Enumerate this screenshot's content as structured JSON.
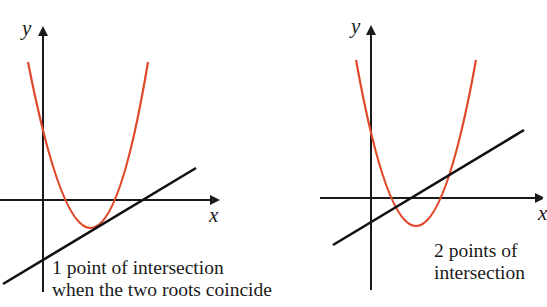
{
  "colors": {
    "curve": "#e0482a",
    "line": "#111111",
    "axes": "#1a1a1a",
    "background": "#ffffff"
  },
  "graphs": [
    {
      "id": "left",
      "axis_labels": {
        "x": "x",
        "y": "y"
      },
      "caption_lines": [
        "1 point of intersection",
        "when the two roots coincide"
      ],
      "description": "Parabola with a line tangent to it at the vertex region"
    },
    {
      "id": "right",
      "axis_labels": {
        "x": "x",
        "y": "y"
      },
      "caption_lines": [
        "2 points of",
        "intersection"
      ],
      "description": "Parabola crossed by a line at two points"
    }
  ]
}
